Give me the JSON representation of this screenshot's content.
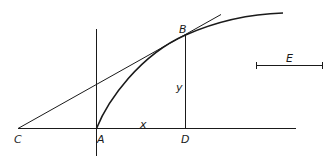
{
  "diagram": {
    "labels": {
      "point_c": "C",
      "point_a": "A",
      "point_d": "D",
      "point_b": "B",
      "var_x": "x",
      "var_y": "y",
      "segment_e": "E"
    },
    "color": "#1a1a1a"
  }
}
